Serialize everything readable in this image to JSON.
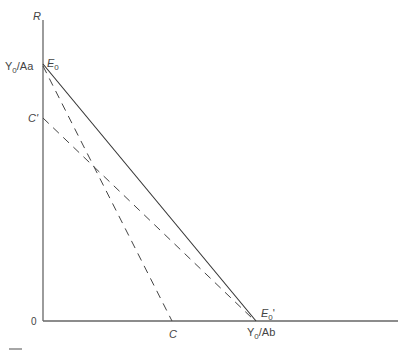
{
  "diagram": {
    "axes": {
      "y_label": "R",
      "origin_label": "0"
    },
    "points": {
      "E0": {
        "name": "E",
        "sub": "0",
        "prime": ""
      },
      "E0prime": {
        "name": "E",
        "sub": "0",
        "prime": "'"
      },
      "Cprime": {
        "name": "C'"
      },
      "C": {
        "name": "C"
      }
    },
    "intercepts": {
      "y_intercept": {
        "pre": "Y",
        "sub": "0",
        "post": "/Aa"
      },
      "x_intercept": {
        "pre": "Y",
        "sub": "0",
        "post": "/Ab"
      }
    },
    "lines": [
      {
        "name": "budget-line-solid",
        "from": "E0",
        "to": "E0prime",
        "style": "solid"
      },
      {
        "name": "dashed-line-E0-C",
        "from": "E0",
        "to": "C",
        "style": "dashed"
      },
      {
        "name": "dashed-line-Cprime-E0prime",
        "from": "Cprime",
        "to": "E0prime",
        "style": "dashed"
      }
    ],
    "colors": {
      "line": "#333333",
      "axis": "#555555",
      "text": "#444444"
    }
  }
}
